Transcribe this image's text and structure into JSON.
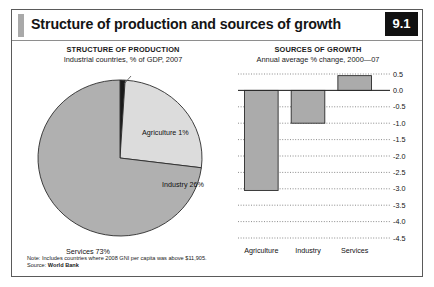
{
  "header": {
    "title": "Structure of production and sources of growth",
    "badge": "9.1"
  },
  "panels": {
    "left": {
      "title": "STRUCTURE OF PRODUCTION",
      "subtitle": "Industrial countries, % of GDP, 2007"
    },
    "right": {
      "title": "SOURCES OF GROWTH",
      "subtitle": "Annual average % change, 2000—07"
    }
  },
  "footnote": {
    "note": "Note: Includes countries where 2008 GNI per capita was above $11,905.",
    "source_label": "Source: ",
    "source_value": "World Bank"
  },
  "colors": {
    "agriculture": "#1a1a1a",
    "industry": "#dcdcdc",
    "services": "#b0b0b0",
    "bar_fill": "#ababab",
    "bar_stroke": "#2b2b2b",
    "badge_bg": "#111111",
    "accent": "#a9a9a9",
    "frame": "#5a5a5a"
  },
  "chart_data": [
    {
      "type": "pie",
      "title": "STRUCTURE OF PRODUCTION",
      "subtitle": "Industrial countries, % of GDP, 2007",
      "unit": "% of GDP",
      "categories": [
        "Agriculture",
        "Industry",
        "Services"
      ],
      "values": [
        1,
        26,
        73
      ],
      "labels": [
        "Agriculture 1%",
        "Industry 26%",
        "Services 73%"
      ],
      "slice_colors": [
        "#1a1a1a",
        "#dcdcdc",
        "#b0b0b0"
      ],
      "legend": "none",
      "start_angle_deg": -90
    },
    {
      "type": "bar",
      "title": "SOURCES OF GROWTH",
      "subtitle": "Annual average % change, 2000—07",
      "categories": [
        "Agriculture",
        "Industry",
        "Services"
      ],
      "values": [
        -3.05,
        -1.0,
        0.45
      ],
      "xlabel": "",
      "ylabel": "",
      "ylim": [
        -4.5,
        0.5
      ],
      "yticks": [
        0.5,
        0.0,
        -0.5,
        -1.0,
        -1.5,
        -2.0,
        -2.5,
        -3.0,
        -3.5,
        -4.0,
        -4.5
      ],
      "ytick_labels": [
        "0.5",
        "0.0",
        "-0.5",
        "-1.0",
        "-1.5",
        "-2.0",
        "-2.5",
        "-3.0",
        "-3.5",
        "-4.0",
        "-4.5"
      ],
      "grid": true,
      "grid_style": "dotted",
      "tick_side": "right",
      "legend": "none"
    }
  ]
}
